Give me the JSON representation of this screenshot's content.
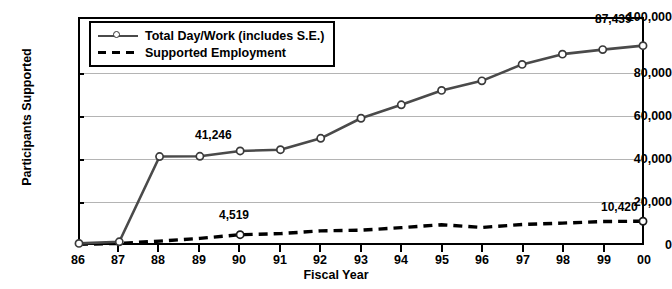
{
  "chart_data": {
    "type": "line",
    "title": "",
    "xlabel": "Fiscal Year",
    "ylabel": "Participants Supported",
    "categories": [
      "86",
      "87",
      "88",
      "89",
      "90",
      "91",
      "92",
      "93",
      "94",
      "95",
      "96",
      "97",
      "98",
      "99",
      "00"
    ],
    "ylim": [
      0,
      100000
    ],
    "yticks": [
      0,
      20000,
      40000,
      60000,
      80000,
      100000
    ],
    "ytick_labels": [
      "0",
      "20,000",
      "40,000",
      "60,000",
      "80,000",
      "100,000"
    ],
    "grid": true,
    "legend_position": "top-left",
    "series": [
      {
        "name": "Total Day/Work (includes S.E.)",
        "style": "solid-with-markers",
        "color": "#4a4a4a",
        "values": [
          700,
          1400,
          38800,
          38900,
          41246,
          41800,
          46800,
          55600,
          61500,
          67800,
          72000,
          79200,
          83700,
          85700,
          87439
        ]
      },
      {
        "name": "Supported Employment",
        "style": "dashed",
        "color": "#000000",
        "values": [
          300,
          700,
          1700,
          2900,
          4519,
          5000,
          6200,
          6500,
          7600,
          8900,
          7700,
          9000,
          9600,
          10300,
          10420
        ]
      }
    ],
    "annotations": [
      {
        "text": "41,246",
        "series": "Total Day/Work (includes S.E.)",
        "category": "90"
      },
      {
        "text": "87,439",
        "series": "Total Day/Work (includes S.E.)",
        "category": "00"
      },
      {
        "text": "4,519",
        "series": "Supported Employment",
        "category": "90"
      },
      {
        "text": "10,420",
        "series": "Supported Employment",
        "category": "00"
      }
    ]
  },
  "axes": {
    "y_title": "Participants Supported",
    "x_title": "Fiscal Year",
    "y_tick_labels": [
      "100,000",
      "80,000",
      "60,000",
      "40,000",
      "20,000",
      "0"
    ],
    "x_tick_labels": [
      "86",
      "87",
      "88",
      "89",
      "90",
      "91",
      "92",
      "93",
      "94",
      "95",
      "96",
      "97",
      "98",
      "99",
      "00"
    ]
  },
  "legend": {
    "items": [
      {
        "label": "Total Day/Work (includes S.E.)"
      },
      {
        "label": "Supported Employment"
      }
    ]
  },
  "annotations": {
    "total_90": "41,246",
    "total_00": "87,439",
    "se_90": "4,519",
    "se_00": "10,420"
  }
}
